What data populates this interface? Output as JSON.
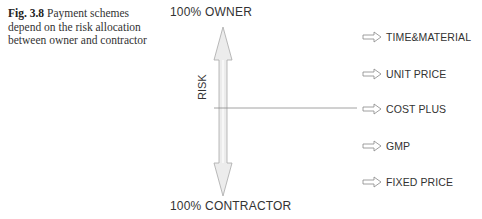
{
  "caption": {
    "figure_number": "Fig. 3.8",
    "text": "Payment schemes depend on the risk allocation between owner and contractor"
  },
  "axis": {
    "top_label": "100% OWNER",
    "bottom_label": "100% CONTRACTOR",
    "axis_label": "RISK"
  },
  "schemes": [
    {
      "label": "TIME&MATERIAL"
    },
    {
      "label": "UNIT PRICE"
    },
    {
      "label": "COST PLUS"
    },
    {
      "label": "GMP"
    },
    {
      "label": "FIXED PRICE"
    }
  ],
  "indicator": {
    "points_to": "COST PLUS"
  }
}
